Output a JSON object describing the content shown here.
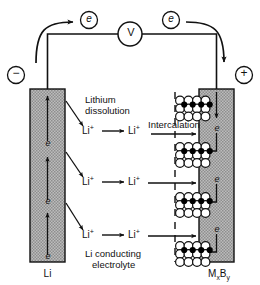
{
  "diagram": {
    "colors": {
      "stroke": "#111111",
      "electrode_fill": "#b4b4b4",
      "lattice_open": "#ffffff",
      "lattice_filled": "#000000",
      "background": "#ffffff"
    },
    "meter": {
      "label": "V",
      "name": "voltmeter"
    },
    "terminals": {
      "negative": "−",
      "positive": "+"
    },
    "electron_markers": {
      "symbol": "e",
      "external_left": "e",
      "external_right": "e",
      "anode_count": 3,
      "cathode_count": 3
    },
    "electrodes": {
      "anode": {
        "label": "Li",
        "name": "lithium-anode"
      },
      "cathode": {
        "label_m": "M",
        "label_x": "x",
        "label_b": "B",
        "label_y": "y",
        "name": "intercalation-cathode"
      }
    },
    "annotations": {
      "dissolution_line1": "Lithium",
      "dissolution_line2": "dissolution",
      "intercalation": "Intercalation",
      "electrolyte_line1": "Li conducting",
      "electrolyte_line2": "electrolyte"
    },
    "ion_rows": [
      {
        "left": "Li",
        "left_sup": "+",
        "right": "Li",
        "right_sup": "+"
      },
      {
        "left": "Li",
        "left_sup": "+",
        "right": "Li",
        "right_sup": "+"
      },
      {
        "left": "Li",
        "left_sup": "+",
        "right": "Li",
        "right_sup": "+"
      }
    ],
    "lattice_blocks": [
      {
        "rows": 3,
        "cols": 4,
        "filled_row": 1
      },
      {
        "rows": 3,
        "cols": 4,
        "filled_row": 1
      },
      {
        "rows": 3,
        "cols": 4,
        "filled_row": 1
      },
      {
        "rows": 3,
        "cols": 4,
        "filled_row": 1
      }
    ]
  }
}
